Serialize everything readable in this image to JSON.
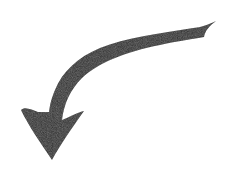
{
  "image": {
    "description": "Curved arrow pointing down-left",
    "width": 225,
    "height": 174,
    "background": "#ffffff",
    "fill_color": "#2a2a2a"
  },
  "arrow": {
    "icon": "curved-arrow-down-icon",
    "direction": "down"
  }
}
